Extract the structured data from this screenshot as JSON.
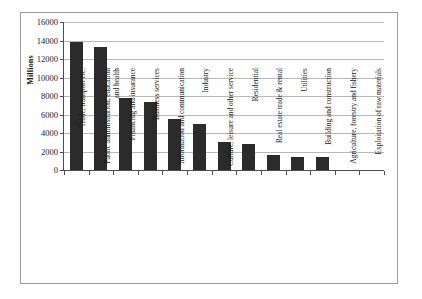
{
  "chart_data": {
    "type": "bar",
    "title": "",
    "xlabel": "",
    "ylabel": "Millions",
    "ylim": [
      0,
      16000
    ],
    "ytick_step": 2000,
    "yticks": [
      0,
      2000,
      4000,
      6000,
      8000,
      10000,
      12000,
      14000,
      16000
    ],
    "ytick_labels": [
      "0",
      "2000",
      "4000",
      "6000",
      "8000",
      "10000",
      "12000",
      "14000",
      "16000"
    ],
    "grid": true,
    "legend": null,
    "bar_color": "#2b2b2b",
    "gridline_color": "#b8b8b8",
    "axis_color": "#4d4d4d",
    "frame_color": "#9a9a9a",
    "categories": [
      "Trade, transport etc.",
      "Public administration, education and health",
      "Financing and insurance",
      "Business services",
      "Information and communication",
      "Industry",
      "Culture, leisure and other service",
      "Residential",
      "Real estate trade & rental",
      "Utilities",
      "Building and construction",
      "Agriculture, forestry and fishery",
      "Exploitation of raw materials"
    ],
    "values": [
      13850,
      13300,
      7800,
      7300,
      5550,
      4950,
      3000,
      2850,
      1600,
      1450,
      1400,
      null,
      null
    ]
  }
}
